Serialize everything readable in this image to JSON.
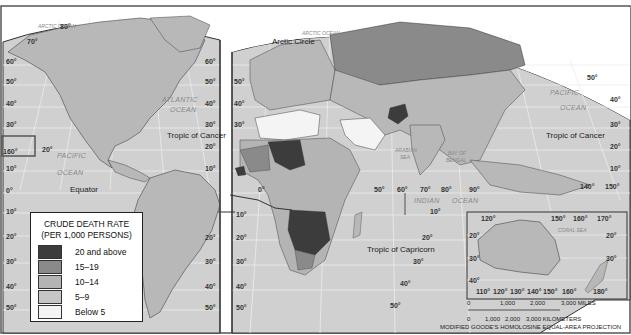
{
  "map": {
    "title": "CRUDE DEATH RATE",
    "subtitle": "(PER 1,000 PERSONS)",
    "projection": "MODIFIED GOODE'S HOMOLOSINE EQUAL-AREA PROJECTION"
  },
  "colors": {
    "ocean": "#d0d0d0",
    "land_default": "#b8b8b8",
    "border": "#333333",
    "graticule": "#ececec"
  },
  "legend": {
    "title": "CRUDE DEATH RATE",
    "subtitle": "(PER 1,000 PERSONS)",
    "items": [
      {
        "label": "20 and above",
        "color": "#3c3c3c"
      },
      {
        "label": "15–19",
        "color": "#8a8a8a"
      },
      {
        "label": "10–14",
        "color": "#b4b4b4"
      },
      {
        "label": "5–9",
        "color": "#c6c6c6"
      },
      {
        "label": "Below 5",
        "color": "#f4f4f4"
      }
    ]
  },
  "labels": {
    "oceans": {
      "arctic_left": "ARCTIC OCEAN",
      "arctic_right": "ARCTIC OCEAN",
      "atlantic_1": "ATLANTIC",
      "atlantic_2": "OCEAN",
      "pacific_left_1": "PACIFIC",
      "pacific_left_2": "OCEAN",
      "pacific_right_1": "PACIFIC",
      "pacific_right_2": "OCEAN",
      "indian_1": "INDIAN",
      "indian_2": "OCEAN",
      "arabian_1": "ARABIAN",
      "arabian_2": "SEA",
      "bengal_1": "BAY OF",
      "bengal_2": "BENGAL",
      "coral_sea": "CORAL SEA"
    },
    "lines": {
      "arctic_circle": "Arctic Circle",
      "tropic_cancer_left": "Tropic of Cancer",
      "tropic_cancer_right": "Tropic of Cancer",
      "equator": "Equator",
      "tropic_capricorn": "Tropic of Capricorn"
    },
    "degrees": {
      "left_edge": [
        "60°",
        "50°",
        "40°",
        "30°",
        "20°",
        "10°",
        "0°",
        "10°",
        "20°",
        "30°",
        "40°",
        "50°"
      ],
      "na_top": [
        "80°",
        "70°"
      ],
      "na_right": [
        "60°",
        "50°",
        "40°",
        "30°",
        "20°",
        "10°"
      ],
      "hawaii": "160°",
      "pacific_20": "20°",
      "eurasia_left": [
        "50°",
        "40°",
        "30°",
        "20°",
        "10°"
      ],
      "sa_right": [
        "20°",
        "30°",
        "40°",
        "50°"
      ],
      "africa_left": [
        "10°",
        "20°",
        "30°",
        "40°",
        "50°"
      ],
      "prime": "0°",
      "longitudes_mid": [
        "50°",
        "60°",
        "70°",
        "80°",
        "90°"
      ],
      "longitudes_east": [
        "140°",
        "150°"
      ],
      "right_edge": [
        "50°",
        "40°",
        "30°",
        "20°",
        "10°"
      ],
      "indian_south": [
        "10°",
        "20°",
        "30°",
        "40°",
        "50°"
      ],
      "inset_top": [
        "120°",
        "150°",
        "160°",
        "170°"
      ],
      "inset_bottom": [
        "110°",
        "120°",
        "130°",
        "140°",
        "150°",
        "160°",
        "180°"
      ],
      "inset_left": [
        "20°",
        "30°",
        "40°"
      ],
      "inset_right": [
        "20°",
        "30°"
      ]
    }
  },
  "scale": {
    "miles": [
      "0",
      "1,000",
      "2,000",
      "3,000 MILES"
    ],
    "km": [
      "0",
      "1,000",
      "2,000",
      "3,000 KILOMETERS"
    ]
  }
}
